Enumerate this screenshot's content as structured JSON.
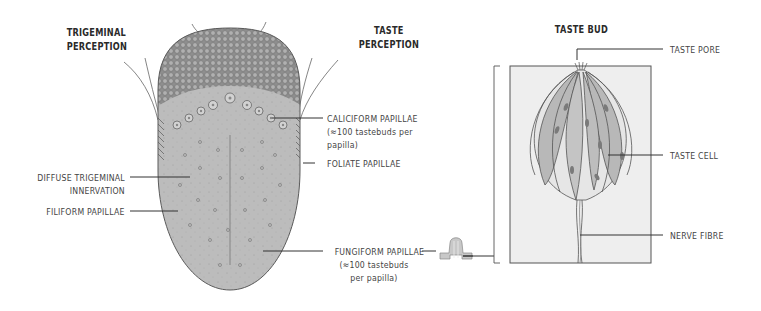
{
  "headings": {
    "trigeminal": [
      "TRIGEMINAL",
      "PERCEPTION"
    ],
    "taste": [
      "TASTE",
      "PERCEPTION"
    ],
    "taste_bud": "TASTE BUD"
  },
  "tongue_labels": {
    "caliciform": [
      "CALICIFORM PAPILLAE",
      "(≈100 tastebuds per",
      "papilla)"
    ],
    "foliate": "FOLIATE PAPILLAE",
    "diffuse": [
      "DIFFUSE TRIGEMINAL",
      "INNERVATION"
    ],
    "filiform": "FILIFORM PAPILLAE",
    "fungiform": [
      "FUNGIFORM PAPILLAE",
      "(≈100 tastebuds",
      "per papilla)"
    ]
  },
  "taste_bud_labels": {
    "pore": "TASTE PORE",
    "cell": "TASTE CELL",
    "nerve": "NERVE FIBRE"
  },
  "colors": {
    "tongue_fill": "#b8b8b8",
    "tongue_back": "#9a9a9a",
    "outline": "#555555",
    "bud_box": "#ececec",
    "cell_dark": "#b5b5b5",
    "cell_light": "#e4e4e4"
  }
}
